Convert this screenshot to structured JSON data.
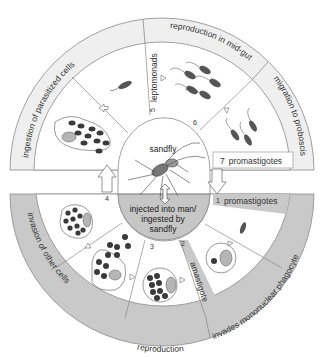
{
  "colors": {
    "ring_top": "#efefef",
    "ring_bottom": "#c9c9c9",
    "inner_bottom_center": "#c6c6c6",
    "line": "#8a8a8a",
    "cell_dark": "#3a3a3a",
    "nucleus": "#b5b5b5"
  },
  "center": {
    "top_label": "sandfly",
    "bottom_line1": "injected into man/",
    "bottom_line2": "ingested by",
    "bottom_line3": "sandfly"
  },
  "outer_ring_top": [
    {
      "id": "ingestion",
      "label": "ingestion of parasitized cells"
    },
    {
      "id": "reproduction_midgut",
      "label": "reproduction in mid-gut"
    },
    {
      "id": "migration",
      "label": "migration to proboscis"
    }
  ],
  "outer_ring_bottom": [
    {
      "id": "invasion",
      "label": "invasion of other cells"
    },
    {
      "id": "reproduction",
      "label": "reproduction"
    },
    {
      "id": "invades",
      "label": "invades mononuclear phagocyte"
    }
  ],
  "stages": [
    {
      "num": "1",
      "label": "promastigotes"
    },
    {
      "num": "2",
      "label": "amastigote"
    },
    {
      "num": "3",
      "label": ""
    },
    {
      "num": "4",
      "label": ""
    },
    {
      "num": "5",
      "label": "leptomonads"
    },
    {
      "num": "6",
      "label": ""
    },
    {
      "num": "7",
      "label": "promastigotes"
    }
  ]
}
